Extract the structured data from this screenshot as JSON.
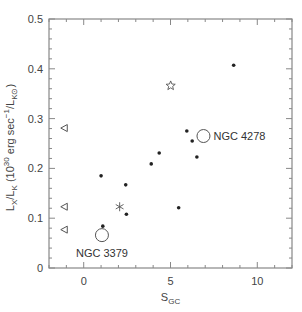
{
  "chart_data": {
    "type": "scatter",
    "title": "",
    "xlabel": {
      "main": "S",
      "sub": "GC"
    },
    "ylabel": {
      "parts": [
        {
          "t": "L",
          "s": "base"
        },
        {
          "t": "X",
          "s": "sub"
        },
        {
          "t": "/L",
          "s": "base"
        },
        {
          "t": "K",
          "s": "sub"
        },
        {
          "t": " (10",
          "s": "base"
        },
        {
          "t": "30",
          "s": "sup"
        },
        {
          "t": " erg sec",
          "s": "base"
        },
        {
          "t": "−1",
          "s": "sup"
        },
        {
          "t": "/L",
          "s": "base"
        },
        {
          "t": "K⊙",
          "s": "sub"
        },
        {
          "t": ")",
          "s": "base"
        }
      ],
      "text": "L_X/L_K (10^30 erg sec^-1/L_K⊙)"
    },
    "xlim": [
      -2,
      12
    ],
    "ylim": [
      0,
      0.5
    ],
    "xticks": [
      0,
      5,
      10
    ],
    "xtick_labels": [
      "0",
      "5",
      "10"
    ],
    "xminor_step": 1,
    "yticks": [
      0,
      0.1,
      0.2,
      0.3,
      0.4,
      0.5
    ],
    "ytick_labels": [
      "0",
      "0.1",
      "0.2",
      "0.3",
      "0.4",
      "0.5"
    ],
    "yminor_step": 0.02,
    "grid": false,
    "legend": "none",
    "series": [
      {
        "name": "detections",
        "marker": "filled-dot",
        "points": [
          {
            "x": 1.0,
            "y": 0.185
          },
          {
            "x": 2.42,
            "y": 0.167
          },
          {
            "x": 2.46,
            "y": 0.108
          },
          {
            "x": 1.1,
            "y": 0.084
          },
          {
            "x": 3.89,
            "y": 0.209
          },
          {
            "x": 4.35,
            "y": 0.231
          },
          {
            "x": 5.47,
            "y": 0.121
          },
          {
            "x": 5.94,
            "y": 0.275
          },
          {
            "x": 6.25,
            "y": 0.255
          },
          {
            "x": 6.52,
            "y": 0.223
          },
          {
            "x": 8.64,
            "y": 0.407
          }
        ]
      },
      {
        "name": "upper-limits",
        "marker": "open-triangle-left",
        "points": [
          {
            "x": -1.12,
            "y": 0.281
          },
          {
            "x": -1.12,
            "y": 0.123
          },
          {
            "x": -1.12,
            "y": 0.077
          }
        ]
      },
      {
        "name": "asterisk",
        "marker": "asterisk",
        "points": [
          {
            "x": 2.07,
            "y": 0.123
          }
        ]
      },
      {
        "name": "open-star",
        "marker": "open-star",
        "points": [
          {
            "x": 5.01,
            "y": 0.366
          }
        ]
      },
      {
        "name": "labeled-galaxies",
        "marker": "open-circle-large",
        "points": [
          {
            "x": 1.05,
            "y": 0.066,
            "label": "NGC 3379",
            "label_pos": "below"
          },
          {
            "x": 6.9,
            "y": 0.265,
            "label": "NGC 4278",
            "label_pos": "right"
          }
        ]
      }
    ],
    "annotations": [
      "NGC 3379",
      "NGC 4278"
    ],
    "colors": {
      "axis": "#888888",
      "marker": "#222222",
      "text": "#444444"
    }
  }
}
